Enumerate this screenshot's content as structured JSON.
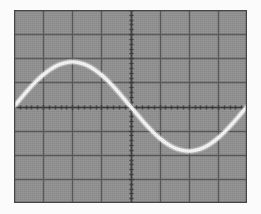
{
  "display": {
    "device_label": "oscilloscope-graticule",
    "screen": {
      "x": 14,
      "y": 10,
      "width": 233,
      "height": 193,
      "background_color": "#8f8f8f",
      "border_color": "#4a4a4a"
    },
    "graticule": {
      "divisions_x": 8,
      "divisions_y": 8,
      "division_width_px": 29.1,
      "division_height_px": 24.1,
      "grid_color": "#555555",
      "grid_line_width": 1.4,
      "axis_color": "#3b3b3b",
      "axis_line_width": 1.6,
      "tick_color": "#3b3b3b",
      "subdivisions_per_division": 5,
      "tick_length_px": 5,
      "tick_length_minor_px": 4,
      "center_x": 130.5,
      "center_y": 106.5
    },
    "trace": {
      "color": "#f2f2f2",
      "line_width": 3.4,
      "glow_color": "#ffffff"
    }
  },
  "chart_data": {
    "type": "line",
    "title": "",
    "subtitle": "",
    "xlabel": "",
    "ylabel": "",
    "grid": true,
    "legend_position": "none",
    "waveform": "sine",
    "amplitude_divisions": 1.85,
    "period_divisions": 8.0,
    "phase": "starts at zero crossing rising at left edge",
    "xlim": [
      -4,
      4
    ],
    "ylim": [
      -4,
      4
    ],
    "x_axis_unit": "divisions",
    "y_axis_unit": "divisions",
    "x": [
      -4.0,
      -3.75,
      -3.5,
      -3.25,
      -3.0,
      -2.75,
      -2.5,
      -2.25,
      -2.0,
      -1.75,
      -1.5,
      -1.25,
      -1.0,
      -0.75,
      -0.5,
      -0.25,
      0.0,
      0.25,
      0.5,
      0.75,
      1.0,
      1.25,
      1.5,
      1.75,
      2.0,
      2.25,
      2.5,
      2.75,
      3.0,
      3.25,
      3.5,
      3.75,
      4.0
    ],
    "y": [
      0.0,
      0.36,
      0.71,
      1.03,
      1.31,
      1.54,
      1.71,
      1.81,
      1.85,
      1.81,
      1.71,
      1.54,
      1.31,
      1.03,
      0.71,
      0.36,
      0.0,
      -0.36,
      -0.71,
      -1.03,
      -1.31,
      -1.54,
      -1.71,
      -1.81,
      -1.85,
      -1.81,
      -1.71,
      -1.54,
      -1.31,
      -1.03,
      -0.71,
      -0.36,
      0.0
    ],
    "markers": [
      {
        "name": "left-zero-crossing",
        "x": -4.0,
        "y": 0.0
      },
      {
        "name": "positive-peak",
        "x": -2.0,
        "y": 1.85
      },
      {
        "name": "center-zero-crossing",
        "x": 0.0,
        "y": 0.0
      },
      {
        "name": "negative-peak",
        "x": 2.0,
        "y": -1.85
      },
      {
        "name": "right-zero-crossing",
        "x": 4.0,
        "y": 0.0
      }
    ],
    "x_tick_labels": [
      "",
      "",
      "",
      "",
      "",
      "",
      "",
      "",
      ""
    ],
    "y_tick_labels": [
      "",
      "",
      "",
      "",
      "",
      "",
      "",
      "",
      ""
    ]
  }
}
